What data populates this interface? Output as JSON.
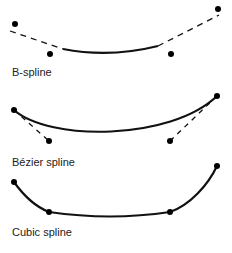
{
  "diagrams": [
    {
      "label": "B-spline",
      "label_y": 66
    },
    {
      "label": "Bézier spline",
      "label_y": 156
    },
    {
      "label": "Cubic spline",
      "label_y": 226
    }
  ],
  "colors": {
    "stroke": "#111111",
    "text": "#222222",
    "background": "#ffffff"
  }
}
